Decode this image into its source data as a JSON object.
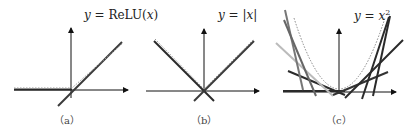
{
  "figure": {
    "panels": [
      {
        "id": "a",
        "caption": "（a）",
        "equation": {
          "lhs": "y",
          "eq": " = ",
          "rhs": "ReLU(",
          "arg": "x",
          "close": ")"
        },
        "description": "ReLU function (dotted) approximated by linear pieces"
      },
      {
        "id": "b",
        "caption": "（b）",
        "equation": {
          "lhs": "y",
          "eq": " = |",
          "arg": "x",
          "close": "|"
        },
        "description": "Absolute value function (dotted) with two linear pieces"
      },
      {
        "id": "c",
        "caption": "（c）",
        "equation": {
          "lhs": "y",
          "eq": " = ",
          "arg": "x",
          "sup": "2"
        },
        "description": "Parabola (dotted) as envelope of several tangent lines"
      }
    ],
    "colors": {
      "axis": "#111111",
      "line_dark": "#2a2a2a",
      "line_mid": "#6e6e6e",
      "line_light": "#b5b5b5",
      "curve_dotted": "#888888"
    }
  }
}
